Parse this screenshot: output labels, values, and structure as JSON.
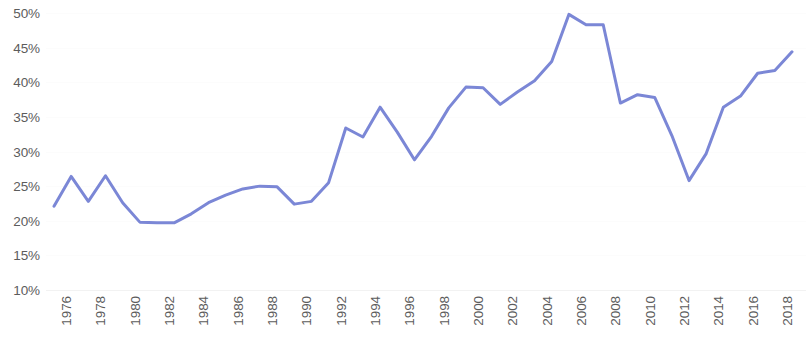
{
  "chart_data": {
    "type": "line",
    "title": "",
    "subtitle": "",
    "xlabel": "",
    "ylabel": "",
    "grid": true,
    "legend": false,
    "legend_position": "none",
    "line_color": "#7b87d6",
    "line_width": 3,
    "axis_text_color": "#5c5c5c",
    "background_color": "#ffffff",
    "gridline_color": "#fcfcfc",
    "ylim": [
      10,
      50
    ],
    "y_tick_step": 5,
    "y_tick_labels": [
      "50%",
      "45%",
      "40%",
      "35%",
      "30%",
      "25%",
      "20%",
      "15%",
      "10%"
    ],
    "y_tick_values": [
      50,
      45,
      40,
      35,
      30,
      25,
      20,
      15,
      10
    ],
    "xlim": [
      1976,
      2019
    ],
    "x_tick_step": 2,
    "x_tick_labels": [
      "1976",
      "1978",
      "1980",
      "1982",
      "1984",
      "1986",
      "1988",
      "1990",
      "1992",
      "1994",
      "1996",
      "1998",
      "2000",
      "2002",
      "2004",
      "2006",
      "2008",
      "2010",
      "2012",
      "2014",
      "2016",
      "2018"
    ],
    "x_tick_values": [
      1976,
      1978,
      1980,
      1982,
      1984,
      1986,
      1988,
      1990,
      1992,
      1994,
      1996,
      1998,
      2000,
      2002,
      2004,
      2006,
      2008,
      2010,
      2012,
      2014,
      2016,
      2018
    ],
    "x": [
      1976,
      1977,
      1978,
      1979,
      1980,
      1981,
      1982,
      1983,
      1984,
      1985,
      1986,
      1987,
      1988,
      1989,
      1990,
      1991,
      1992,
      1993,
      1994,
      1995,
      1996,
      1997,
      1998,
      1999,
      2000,
      2001,
      2002,
      2003,
      2004,
      2005,
      2006,
      2007,
      2008,
      2009,
      2010,
      2011,
      2012,
      2013,
      2014,
      2015,
      2016,
      2017,
      2018,
      2019
    ],
    "values": [
      22.1,
      26.4,
      22.8,
      26.5,
      22.6,
      19.8,
      19.7,
      19.7,
      21.0,
      22.6,
      23.7,
      24.6,
      25.0,
      24.9,
      22.4,
      22.8,
      25.5,
      33.4,
      32.1,
      36.4,
      32.8,
      28.8,
      32.2,
      36.3,
      39.3,
      39.2,
      36.8,
      38.6,
      40.2,
      43.0,
      49.8,
      48.3,
      48.3,
      37.0,
      38.2,
      37.8,
      32.3,
      25.8,
      29.7,
      36.4,
      38.0,
      41.3,
      41.7,
      44.4
    ],
    "series": [
      {
        "name": "series-1",
        "values": [
          22.1,
          26.4,
          22.8,
          26.5,
          22.6,
          19.8,
          19.7,
          19.7,
          21.0,
          22.6,
          23.7,
          24.6,
          25.0,
          24.9,
          22.4,
          22.8,
          25.5,
          33.4,
          32.1,
          36.4,
          32.8,
          28.8,
          32.2,
          36.3,
          39.3,
          39.2,
          36.8,
          38.6,
          40.2,
          43.0,
          49.8,
          48.3,
          48.3,
          37.0,
          38.2,
          37.8,
          32.3,
          25.8,
          29.7,
          36.4,
          38.0,
          41.3,
          41.7,
          44.4
        ]
      }
    ],
    "annotations": []
  }
}
